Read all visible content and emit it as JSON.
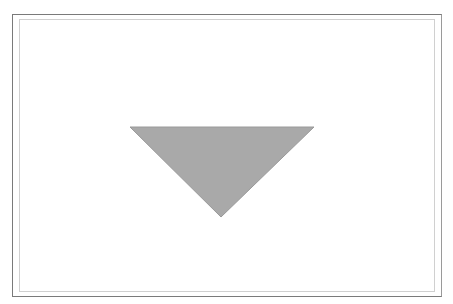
{
  "figure": {
    "shape": "inverted-triangle",
    "fill_color": "#a9a9a9",
    "stroke_color": "#9a9a9a",
    "frame_outer_color": "#7a7a7a",
    "frame_inner_color": "#d0d0d0",
    "points": "130,127 314,127 221,217"
  }
}
